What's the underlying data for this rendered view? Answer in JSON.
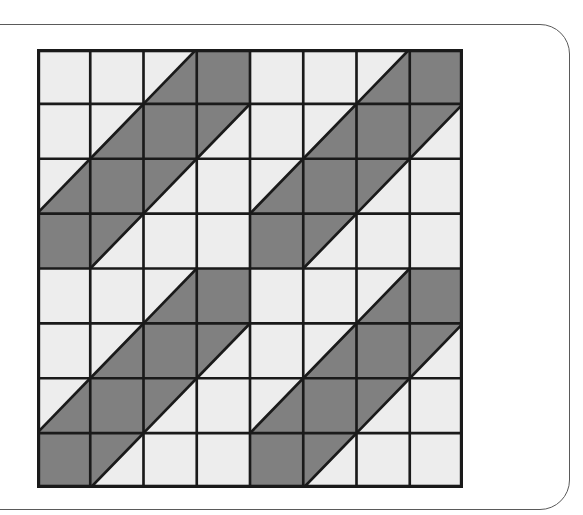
{
  "figure": {
    "rows": 8,
    "columns": 8,
    "cell_types": {
      "light": "blank square",
      "dark": "fully shaded square",
      "diag-lower-right": "diagonal from bottom-left to top-right, lower-right half shaded",
      "diag-upper-left": "diagonal from bottom-left to top-right, upper-left half shaded"
    },
    "colors": {
      "light_fill": "#ededed",
      "dark_fill": "#808080",
      "grid_line": "#1a1a1a",
      "panel_border": "#5a5a5a",
      "background": "#ffffff"
    },
    "grid": [
      [
        "light",
        "light",
        "diag-lower-right",
        "dark",
        "light",
        "light",
        "diag-lower-right",
        "dark"
      ],
      [
        "light",
        "diag-lower-right",
        "dark",
        "diag-upper-left",
        "light",
        "diag-lower-right",
        "dark",
        "diag-upper-left"
      ],
      [
        "diag-lower-right",
        "dark",
        "diag-upper-left",
        "light",
        "diag-lower-right",
        "dark",
        "diag-upper-left",
        "light"
      ],
      [
        "dark",
        "diag-upper-left",
        "light",
        "light",
        "dark",
        "diag-upper-left",
        "light",
        "light"
      ],
      [
        "light",
        "light",
        "diag-lower-right",
        "dark",
        "light",
        "light",
        "diag-lower-right",
        "dark"
      ],
      [
        "light",
        "diag-lower-right",
        "dark",
        "diag-upper-left",
        "light",
        "diag-lower-right",
        "dark",
        "diag-upper-left"
      ],
      [
        "diag-lower-right",
        "dark",
        "diag-upper-left",
        "light",
        "diag-lower-right",
        "dark",
        "diag-upper-left",
        "light"
      ],
      [
        "dark",
        "diag-upper-left",
        "light",
        "light",
        "dark",
        "diag-upper-left",
        "light",
        "light"
      ]
    ]
  }
}
